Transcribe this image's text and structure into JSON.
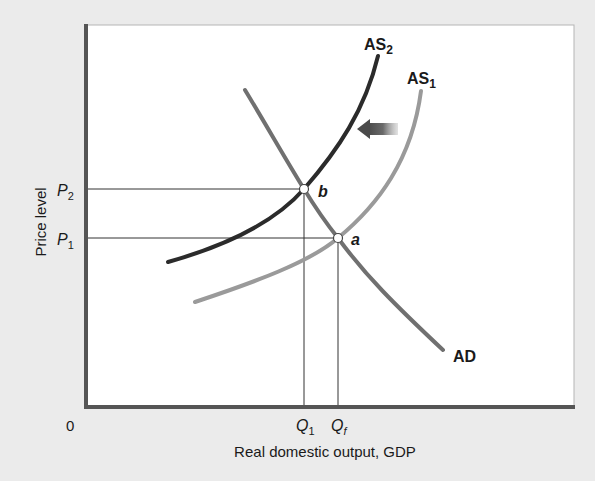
{
  "diagram": {
    "y_axis_label": "Price level",
    "x_axis_label": "Real domestic output, GDP",
    "origin_label": "0",
    "price_ticks": [
      {
        "base": "P",
        "sub": "2"
      },
      {
        "base": "P",
        "sub": "1"
      }
    ],
    "quantity_ticks": [
      {
        "base": "Q",
        "sub": "1"
      },
      {
        "base": "Q",
        "sub": "f"
      }
    ],
    "curves": [
      {
        "name": "AS",
        "sub": "2",
        "color": "#2b2b2b"
      },
      {
        "name": "AS",
        "sub": "1",
        "color": "#9a9a9a"
      },
      {
        "name": "AD",
        "sub": "",
        "color": "#707070"
      }
    ],
    "points": [
      {
        "label": "b"
      },
      {
        "label": "a"
      }
    ],
    "shift_arrow": "leftward shift of aggregate supply from AS1 to AS2"
  },
  "colors": {
    "background": "#ebebeb",
    "plot_area": "#ffffff",
    "axis": "#555555"
  }
}
